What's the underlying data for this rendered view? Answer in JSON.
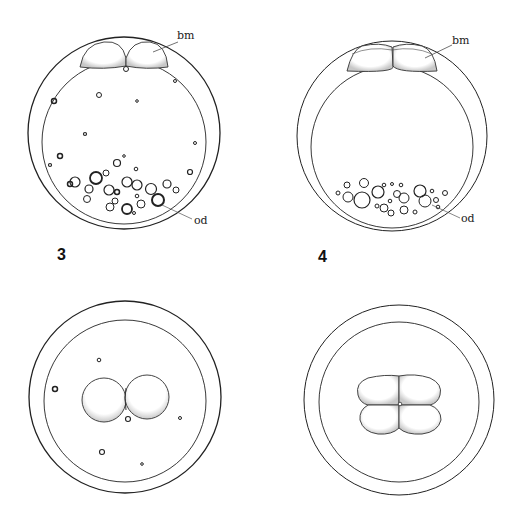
{
  "figure": {
    "panels": [
      {
        "id": "panel-3",
        "number": "3",
        "stage": "2-cell, lateral view",
        "labels": {
          "blastomere": "bm",
          "oil_droplets": "od"
        }
      },
      {
        "id": "panel-4",
        "number": "4",
        "stage": "4-cell, lateral view",
        "labels": {
          "blastomere": "bm",
          "oil_droplets": "od"
        }
      },
      {
        "id": "panel-bottom-left",
        "number": "",
        "stage": "2-cell, animal pole view"
      },
      {
        "id": "panel-bottom-right",
        "number": "",
        "stage": "4-cell, animal pole view"
      }
    ],
    "colors": {
      "line": "#222222",
      "background": "#ffffff",
      "stipple": "#888888"
    }
  }
}
